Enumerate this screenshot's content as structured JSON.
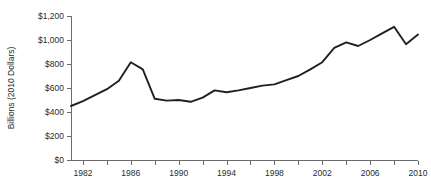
{
  "chart_data": {
    "type": "line",
    "title": "",
    "xlabel": "",
    "ylabel": "Billions (2010 Dollars)",
    "xlim": [
      1981,
      2010
    ],
    "ylim": [
      0,
      1200
    ],
    "grid": false,
    "legend": "none",
    "x_tick_labels": [
      "1982",
      "1986",
      "1990",
      "1994",
      "1998",
      "2002",
      "2006",
      "2010"
    ],
    "x_tick_values": [
      1982,
      1986,
      1990,
      1994,
      1998,
      2002,
      2006,
      2010
    ],
    "x_minor_tick_values": [
      1982,
      1984,
      1986,
      1988,
      1990,
      1992,
      1994,
      1996,
      1998,
      2000,
      2002,
      2004,
      2006,
      2008,
      2010
    ],
    "y_tick_labels": [
      "$0",
      "$200",
      "$400",
      "$600",
      "$800",
      "$1,000",
      "$1,200"
    ],
    "y_tick_values": [
      0,
      200,
      400,
      600,
      800,
      1000,
      1200
    ],
    "x": [
      1981,
      1982,
      1983,
      1984,
      1985,
      1986,
      1987,
      1988,
      1989,
      1990,
      1991,
      1992,
      1993,
      1994,
      1995,
      1996,
      1997,
      1998,
      1999,
      2000,
      2001,
      2002,
      2003,
      2004,
      2005,
      2006,
      2007,
      2008,
      2009,
      2010
    ],
    "values": [
      450,
      490,
      540,
      590,
      660,
      815,
      755,
      510,
      495,
      500,
      485,
      520,
      580,
      565,
      580,
      600,
      620,
      630,
      665,
      700,
      755,
      815,
      935,
      980,
      950,
      1000,
      1055,
      1110,
      965,
      1045
    ],
    "series": [
      {
        "name": "value",
        "color": "#231f20",
        "values": [
          450,
          490,
          540,
          590,
          660,
          815,
          755,
          510,
          495,
          500,
          485,
          520,
          580,
          565,
          580,
          600,
          620,
          630,
          665,
          700,
          755,
          815,
          935,
          980,
          950,
          1000,
          1055,
          1110,
          965,
          1045
        ]
      }
    ]
  }
}
